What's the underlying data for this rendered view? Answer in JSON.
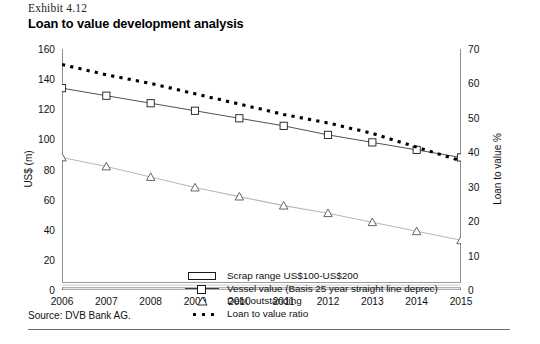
{
  "header": {
    "exhibit_label": "Exhibit 4.12",
    "title": "Loan to value development analysis"
  },
  "source": {
    "text": "Source: DVB Bank AG."
  },
  "axes": {
    "left_title": "US$ (m)",
    "right_title": "Loan to value %",
    "left_ticks": [
      "0",
      "20",
      "40",
      "60",
      "80",
      "100",
      "120",
      "140",
      "160"
    ],
    "right_ticks": [
      "0",
      "10",
      "20",
      "30",
      "40",
      "50",
      "60",
      "70"
    ],
    "x_ticks": [
      "2006",
      "2007",
      "2008",
      "2009",
      "2010",
      "2011",
      "2012",
      "2013",
      "2014",
      "2015"
    ]
  },
  "legend": {
    "items": [
      {
        "key": "band-icon",
        "label": "Scrap range US$100-US$200"
      },
      {
        "key": "line-square-icon",
        "label": "Vessel value (Basis 25 year straight line deprec)"
      },
      {
        "key": "triangle-icon",
        "label": "Debt outstanding"
      },
      {
        "key": "dotted-line-icon",
        "label": "Loan to value ratio"
      }
    ]
  },
  "colors": {
    "vessel_line": "#3c3c3c",
    "debt_line": "#b9b9b9",
    "ratio_line": "#000000",
    "axis": "#555555",
    "scrap_band": "#9a9a9a"
  },
  "chart_data": {
    "type": "line",
    "title": "Loan to value development analysis",
    "xlabel": "",
    "ylabel": "US$ (m)",
    "y2label": "Loan to value %",
    "ylim": [
      0,
      160
    ],
    "y2lim": [
      0,
      70
    ],
    "grid": false,
    "legend_position": "inside-lower-left",
    "categories": [
      "2006",
      "2007",
      "2008",
      "2009",
      "2010",
      "2011",
      "2012",
      "2013",
      "2014",
      "2015"
    ],
    "series": [
      {
        "name": "Vessel value (Basis 25 year straight line deprec)",
        "axis": "left",
        "marker": "square",
        "values": [
          134,
          129,
          124,
          119,
          114,
          109,
          103,
          98,
          93,
          88
        ]
      },
      {
        "name": "Debt outstanding",
        "axis": "left",
        "marker": "triangle",
        "values": [
          88,
          82,
          75,
          68,
          62,
          56,
          51,
          45,
          39,
          33
        ]
      },
      {
        "name": "Loan to value ratio",
        "axis": "right",
        "marker": "none",
        "style": "dotted",
        "values": [
          65.5,
          62.5,
          60.0,
          57.0,
          54.0,
          51.0,
          48.5,
          45.5,
          41.5,
          37.5
        ]
      }
    ],
    "bands": [
      {
        "name": "Scrap range US$100-US$200",
        "axis": "left",
        "y_low": 1.5,
        "y_high": 5.0
      }
    ]
  }
}
